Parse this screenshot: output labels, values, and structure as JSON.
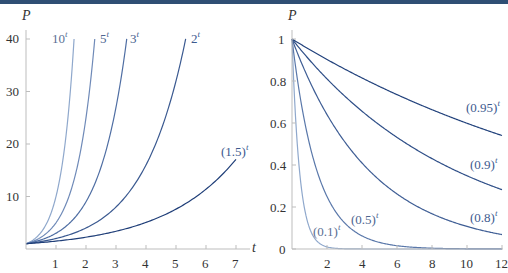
{
  "chart_data": [
    {
      "type": "line",
      "title": "",
      "xlabel": "t",
      "ylabel": "P",
      "xlim": [
        0,
        7.4
      ],
      "ylim": [
        0,
        40
      ],
      "x_ticks": [
        1,
        2,
        3,
        4,
        5,
        6,
        7
      ],
      "y_ticks": [
        10,
        20,
        30,
        40
      ],
      "grid": false,
      "legend": "inline labels at curve ends",
      "series": [
        {
          "name": "10^t",
          "base": 10,
          "label_base": "10",
          "label_exp": "t",
          "color": "#8fa8cc",
          "x_end": 1.602
        },
        {
          "name": "5^t",
          "base": 5,
          "label_base": "5",
          "label_exp": "t",
          "color": "#6f8ab8",
          "x_end": 2.292
        },
        {
          "name": "3^t",
          "base": 3,
          "label_base": "3",
          "label_exp": "t",
          "color": "#4f6ea3",
          "x_end": 3.358
        },
        {
          "name": "2^t",
          "base": 2,
          "label_base": "2",
          "label_exp": "t",
          "color": "#3a5990",
          "x_end": 5.322
        },
        {
          "name": "(1.5)^t",
          "base": 1.5,
          "label_base": "(1.5)",
          "label_exp": "t",
          "color": "#1f3e78",
          "x_end": 7.0
        }
      ]
    },
    {
      "type": "line",
      "title": "",
      "xlabel": "t",
      "ylabel": "P",
      "xlim": [
        0,
        12
      ],
      "ylim": [
        0,
        1
      ],
      "x_ticks": [
        2,
        4,
        6,
        8,
        10,
        12
      ],
      "y_ticks": [
        0,
        0.2,
        0.4,
        0.6,
        0.8,
        1
      ],
      "grid": false,
      "legend": "inline labels near curves",
      "series": [
        {
          "name": "(0.1)^t",
          "base": 0.1,
          "label_base": "(0.1)",
          "label_exp": "t",
          "color": "#8fa8cc",
          "x_end": 12
        },
        {
          "name": "(0.5)^t",
          "base": 0.5,
          "label_base": "(0.5)",
          "label_exp": "t",
          "color": "#5a78aa",
          "x_end": 12
        },
        {
          "name": "(0.8)^t",
          "base": 0.8,
          "label_base": "(0.8)",
          "label_exp": "t",
          "color": "#3f5e95",
          "x_end": 12
        },
        {
          "name": "(0.9)^t",
          "base": 0.9,
          "label_base": "(0.9)",
          "label_exp": "t",
          "color": "#2f4f88",
          "x_end": 12
        },
        {
          "name": "(0.95)^t",
          "base": 0.95,
          "label_base": "(0.95)",
          "label_exp": "t",
          "color": "#22427c",
          "x_end": 12
        }
      ]
    }
  ],
  "labels": {
    "left_y_title": "P",
    "left_x_title": "t",
    "right_y_title": "P",
    "left_x_ticks": [
      "1",
      "2",
      "3",
      "4",
      "5",
      "6",
      "7"
    ],
    "left_y_ticks": [
      "10",
      "20",
      "30",
      "40"
    ],
    "right_x_ticks": [
      "2",
      "4",
      "6",
      "8",
      "10",
      "12"
    ],
    "right_y_ticks": [
      "0",
      "0.2",
      "0.4",
      "0.6",
      "0.8",
      "1"
    ],
    "left_curves": [
      {
        "base": "10",
        "exp": "t"
      },
      {
        "base": "5",
        "exp": "t"
      },
      {
        "base": "3",
        "exp": "t"
      },
      {
        "base": "2",
        "exp": "t"
      },
      {
        "base": "(1.5)",
        "exp": "t"
      }
    ],
    "right_curves": [
      {
        "base": "(0.1)",
        "exp": "t"
      },
      {
        "base": "(0.5)",
        "exp": "t"
      },
      {
        "base": "(0.8)",
        "exp": "t"
      },
      {
        "base": "(0.9)",
        "exp": "t"
      },
      {
        "base": "(0.95)",
        "exp": "t"
      }
    ]
  },
  "colors": {
    "top_band": "#2f4f74",
    "axis": "#b8b8b8",
    "text": "#333333",
    "label_text": "#3d5a8f"
  }
}
